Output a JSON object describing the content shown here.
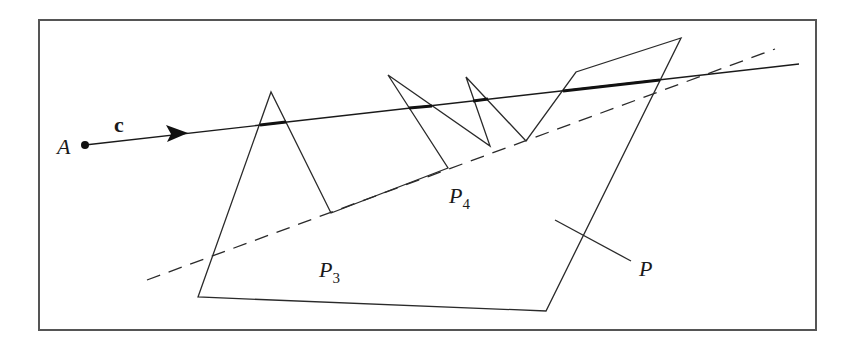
{
  "figure": {
    "type": "geometry-diagram",
    "colors": {
      "background": "#ffffff",
      "stroke": "#2a2a2a",
      "frame": "#555555"
    }
  },
  "labels": {
    "point_a": "A",
    "vector_c": "c",
    "p3_main": "P",
    "p3_sub": "3",
    "p4_main": "P",
    "p4_sub": "4",
    "polygon": "P"
  },
  "geometry": {
    "frame": {
      "x": 39,
      "y": 20,
      "width": 777,
      "height": 310
    },
    "point_a": [
      85,
      145
    ],
    "ray_end": [
      799,
      64
    ],
    "arrow_tip": [
      188,
      133
    ],
    "polygon_vertices": [
      [
        198,
        297
      ],
      [
        271,
        92
      ],
      [
        331,
        213
      ],
      [
        448,
        168
      ],
      [
        388,
        75
      ],
      [
        490,
        146
      ],
      [
        466,
        77
      ],
      [
        526,
        141
      ],
      [
        576,
        72
      ],
      [
        681,
        38
      ],
      [
        546,
        311
      ]
    ],
    "p3": [
      331,
      213
    ],
    "p4": [
      448,
      168
    ],
    "dashed_line": {
      "start": [
        147,
        280
      ],
      "end": [
        775,
        49
      ]
    },
    "p_leader": {
      "start": [
        555,
        220
      ],
      "end": [
        631,
        261
      ]
    }
  }
}
